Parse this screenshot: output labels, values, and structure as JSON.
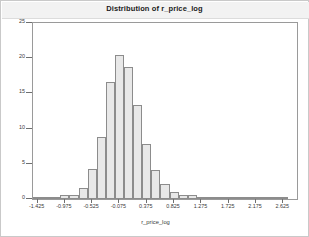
{
  "figure": {
    "title": "Distribution of r_price_log",
    "background_color": "#ffffff",
    "frame_color": "#9a9a9a",
    "title_band_color": "#f2f2f2"
  },
  "axes": {
    "y_title": "Percent",
    "x_title": "r_price_log"
  },
  "chart_data": {
    "type": "bar",
    "title": "Distribution of r_price_log",
    "subtitle": "",
    "xlabel": "r_price_log",
    "ylabel": "Percent",
    "grid": false,
    "legend": null,
    "legend_position": "none",
    "bar_fill_color": "#e8e8e8",
    "bar_edge_color": "#8c8c8c",
    "xlim": [
      -1.5,
      2.85
    ],
    "ylim": [
      0,
      25
    ],
    "xticks": [
      -1.425,
      -0.975,
      -0.525,
      -0.075,
      0.375,
      0.825,
      1.275,
      1.725,
      2.175,
      2.625
    ],
    "xtick_labels": [
      "-1.425",
      "-0.975",
      "-0.525",
      "-0.075",
      "0.375",
      "0.825",
      "1.275",
      "1.725",
      "2.175",
      "2.625"
    ],
    "yticks": [
      0,
      5,
      10,
      15,
      20,
      25
    ],
    "ytick_labels": [
      "0",
      "5",
      "10",
      "15",
      "20",
      "25"
    ],
    "bin_width": 0.15,
    "categories": [
      "-1.425",
      "-1.275",
      "-1.125",
      "-0.975",
      "-0.825",
      "-0.675",
      "-0.525",
      "-0.375",
      "-0.225",
      "-0.075",
      "0.075",
      "0.225",
      "0.375",
      "0.525",
      "0.675",
      "0.825",
      "0.975",
      "1.125",
      "1.275",
      "1.425",
      "1.575",
      "1.725",
      "1.875",
      "2.025",
      "2.175",
      "2.325",
      "2.475",
      "2.625"
    ],
    "x": [
      -1.425,
      -1.275,
      -1.125,
      -0.975,
      -0.825,
      -0.675,
      -0.525,
      -0.375,
      -0.225,
      -0.075,
      0.075,
      0.225,
      0.375,
      0.525,
      0.675,
      0.825,
      0.975,
      1.125,
      1.275,
      1.425,
      1.575,
      1.725,
      1.875,
      2.025,
      2.175,
      2.325,
      2.475,
      2.625
    ],
    "values": [
      0.1,
      0.1,
      0.15,
      0.5,
      0.6,
      1.5,
      4.2,
      8.8,
      16.6,
      20.5,
      18.7,
      13.3,
      7.8,
      4.1,
      2.2,
      1.0,
      0.6,
      0.5,
      0.3,
      0.2,
      0.15,
      0.1,
      0.1,
      0.08,
      0.05,
      0.05,
      0.05,
      0.05
    ]
  }
}
